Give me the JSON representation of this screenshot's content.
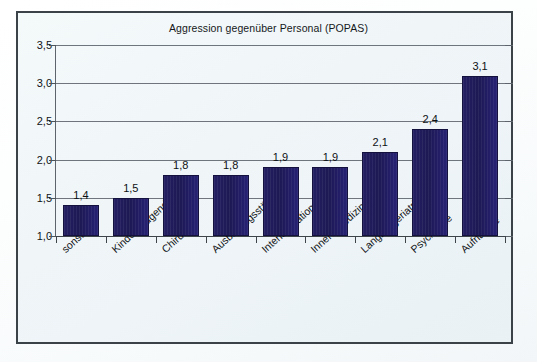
{
  "chart_data": {
    "type": "bar",
    "title": "Aggression gegenüber Personal (POPAS)",
    "xlabel": "",
    "ylabel": "",
    "categories": [
      "sonstige",
      "Kinder&Jugend",
      "Chirurgie",
      "Ausbildungsstätten",
      "Intensivstation",
      "Innere Medizin",
      "Langzeitgeriatrie",
      "Psychiatrie",
      "Aufnahme"
    ],
    "values": [
      1.4,
      1.5,
      1.8,
      1.8,
      1.9,
      1.9,
      2.1,
      2.4,
      3.1
    ],
    "value_labels": [
      "1,4",
      "1,5",
      "1,8",
      "1,8",
      "1,9",
      "1,9",
      "2,1",
      "2,4",
      "3,1"
    ],
    "ylim": [
      1.0,
      3.5
    ],
    "ytick_values": [
      1.0,
      1.5,
      2.0,
      2.5,
      3.0,
      3.5
    ],
    "ytick_labels": [
      "1,0",
      "1,5",
      "2,0",
      "2,5",
      "3,0",
      "3,5"
    ],
    "grid": true,
    "legend": "none",
    "bar_color": "#1d1954",
    "plot_background": "#eef4f6",
    "axis_color": "#3d444a",
    "gridline_color": "#6e757c",
    "decimal_separator": ","
  }
}
